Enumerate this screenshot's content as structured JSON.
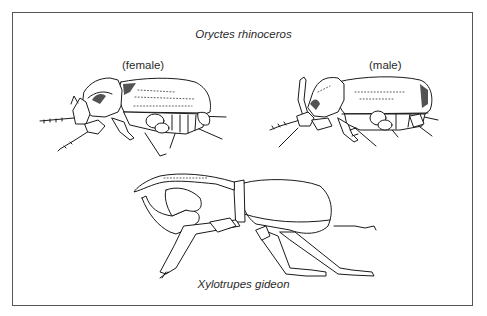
{
  "figure": {
    "title_top": "Oryctes rhinoceros",
    "labels": {
      "female": "(female)",
      "male": "(male)"
    },
    "title_bottom": "Xylotrupes gideon",
    "illustrations": [
      {
        "id": "oryctes-female",
        "caption_ref": "labels.female",
        "species": "Oryctes rhinoceros"
      },
      {
        "id": "oryctes-male",
        "caption_ref": "labels.male",
        "species": "Oryctes rhinoceros"
      },
      {
        "id": "xylotrupes",
        "caption_ref": "title_bottom",
        "species": "Xylotrupes gideon"
      }
    ],
    "colors": {
      "line": "#1a1a1a",
      "frame": "#555555",
      "background": "#ffffff"
    }
  }
}
